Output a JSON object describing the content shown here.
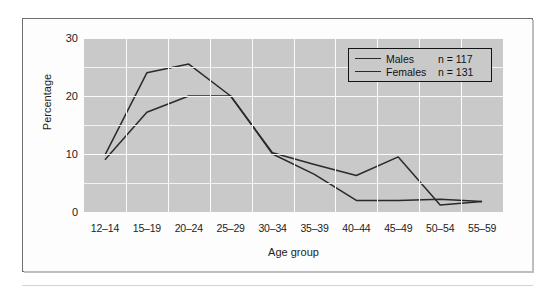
{
  "figure": {
    "background": "#ffffff",
    "plot_background": "#c9c9c9",
    "frame_color": "#6f6f6f"
  },
  "chart_data": {
    "type": "line",
    "title": "",
    "xlabel": "Age group",
    "ylabel": "Percentage",
    "categories": [
      "12–14",
      "15–19",
      "20–24",
      "25–29",
      "30–34",
      "35–39",
      "40–44",
      "45–49",
      "50–54",
      "55–59"
    ],
    "ylim": [
      0,
      30
    ],
    "yticks": [
      0,
      10,
      20,
      30
    ],
    "ytick_labels": [
      "0",
      "10",
      "20",
      "30"
    ],
    "minor_gridlines": [
      5,
      15,
      25
    ],
    "grid": true,
    "legend_position": "top-right",
    "series": [
      {
        "name": "Males",
        "n_label": "n = 117",
        "n": 117,
        "color": "#2a2a2a",
        "values": [
          9.8,
          24.0,
          25.5,
          20.0,
          10.2,
          8.2,
          6.3,
          9.5,
          1.2,
          1.8
        ]
      },
      {
        "name": "Females",
        "n_label": "n = 131",
        "n": 131,
        "color": "#2a2a2a",
        "values": [
          9.0,
          17.2,
          20.0,
          20.0,
          10.0,
          6.5,
          2.0,
          2.0,
          2.2,
          1.8
        ]
      }
    ]
  },
  "legend": {
    "rows": [
      {
        "label": "Males",
        "n_text": "n = 117"
      },
      {
        "label": "Females",
        "n_text": "n = 131"
      }
    ]
  }
}
